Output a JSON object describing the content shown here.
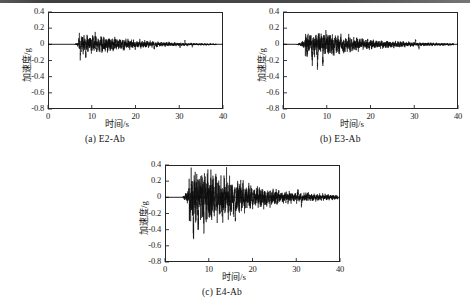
{
  "figure": {
    "type": "multi-panel-time-history",
    "axis_titles": {
      "x": "时间/s",
      "y": "加速度/g"
    },
    "panels": [
      {
        "id": "a",
        "caption": "(a) E2-Ab",
        "record_name": "E2-Ab"
      },
      {
        "id": "b",
        "caption": "(b) E3-Ab",
        "record_name": "E3-Ab"
      },
      {
        "id": "c",
        "caption": "(c) E4-Ab",
        "record_name": "E4-Ab"
      }
    ]
  },
  "chart_data": [
    {
      "type": "line",
      "panel": "a",
      "title": "(a) E2-Ab",
      "xlabel": "时间/s",
      "ylabel": "加速度/g",
      "xlim": [
        0,
        40
      ],
      "ylim": [
        -0.8,
        0.4
      ],
      "xticks": [
        0,
        10,
        20,
        30,
        40
      ],
      "yticks": [
        0.4,
        0.2,
        0,
        -0.2,
        -0.4,
        -0.6,
        -0.8
      ],
      "xtick_labels": [
        "0",
        "10",
        "20",
        "30",
        "40"
      ],
      "ytick_labels": [
        "0.4",
        "0.2",
        "0",
        "-0.2",
        "-0.4",
        "-0.6",
        "-0.8"
      ],
      "grid": false,
      "legend": false,
      "line_color": "#0d0d0d",
      "signal_start_s": 6.0,
      "signal_end_s": 38.5,
      "peak_positive": 0.12,
      "peak_negative": -0.21,
      "strong_motion_window_s": [
        7.0,
        11.5
      ],
      "description": "Low-amplitude earthquake acceleration record, quiet before 6 s, strongest shaking 7-11.5 s, gradual decay with small bursts near 15 s, 21 s and 30-32 s."
    },
    {
      "type": "line",
      "panel": "b",
      "title": "(b) E3-Ab",
      "xlabel": "时间/s",
      "ylabel": "加速度/g",
      "xlim": [
        0,
        40
      ],
      "ylim": [
        -0.8,
        0.4
      ],
      "xticks": [
        0,
        10,
        20,
        30,
        40
      ],
      "yticks": [
        0.4,
        0.2,
        0,
        -0.2,
        -0.4,
        -0.6,
        -0.8
      ],
      "xtick_labels": [
        "0",
        "10",
        "20",
        "30",
        "40"
      ],
      "ytick_labels": [
        "0.4",
        "0.2",
        "0",
        "-0.2",
        "-0.4",
        "-0.6",
        "-0.8"
      ],
      "grid": false,
      "legend": false,
      "line_color": "#0d0d0d",
      "signal_start_s": 3.0,
      "signal_end_s": 39.0,
      "peak_positive": 0.17,
      "peak_negative": -0.28,
      "strong_motion_window_s": [
        5.0,
        9.5
      ],
      "description": "Moderate acceleration record, onset near 3 s, strongest pulses 5-9.5 s reaching -0.28 g, secondary bursts near 13-16 s and 30-31 s."
    },
    {
      "type": "line",
      "panel": "c",
      "title": "(c) E4-Ab",
      "xlabel": "时间/s",
      "ylabel": "加速度/g",
      "xlim": [
        0,
        40
      ],
      "ylim": [
        -0.8,
        0.4
      ],
      "xticks": [
        0,
        10,
        20,
        30,
        40
      ],
      "yticks": [
        0.4,
        0.2,
        0,
        -0.2,
        -0.4,
        -0.6,
        -0.8
      ],
      "xtick_labels": [
        "0",
        "10",
        "20",
        "30",
        "40"
      ],
      "ytick_labels": [
        "0.4",
        "0.2",
        "0",
        "-0.2",
        "-0.4",
        "-0.6",
        "-0.8"
      ],
      "grid": false,
      "legend": false,
      "line_color": "#0d0d0d",
      "signal_start_s": 4.0,
      "signal_end_s": 39.5,
      "peak_positive": 0.26,
      "peak_negative": -0.63,
      "strong_motion_window_s": [
        5.5,
        10.0
      ],
      "description": "Largest amplitude record; dominant downward spike of -0.63 g near 6.5 s, further large pulses to -0.42 g near 9 s and -0.35 g near 16 s, long decaying coda to 39 s."
    }
  ]
}
